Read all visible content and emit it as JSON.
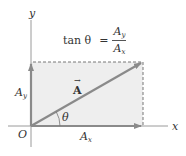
{
  "diagram": {
    "axes": {
      "x_label": "x",
      "y_label": "y",
      "origin_label": "O"
    },
    "vector": {
      "label": "A",
      "arrow_marker": "→"
    },
    "components": {
      "x": {
        "base": "A",
        "sub": "x"
      },
      "y": {
        "base": "A",
        "sub": "y"
      }
    },
    "angle_label": "θ",
    "equation": {
      "lhs": "tan θ",
      "equals": "=",
      "numerator": {
        "base": "A",
        "sub": "y"
      },
      "denominator": {
        "base": "A",
        "sub": "x"
      }
    },
    "colors": {
      "vector": "#8a8a8a",
      "fill": "#eeeeee",
      "axis": "#9a9a9a",
      "dashed": "#777777",
      "text": "#333333"
    }
  }
}
